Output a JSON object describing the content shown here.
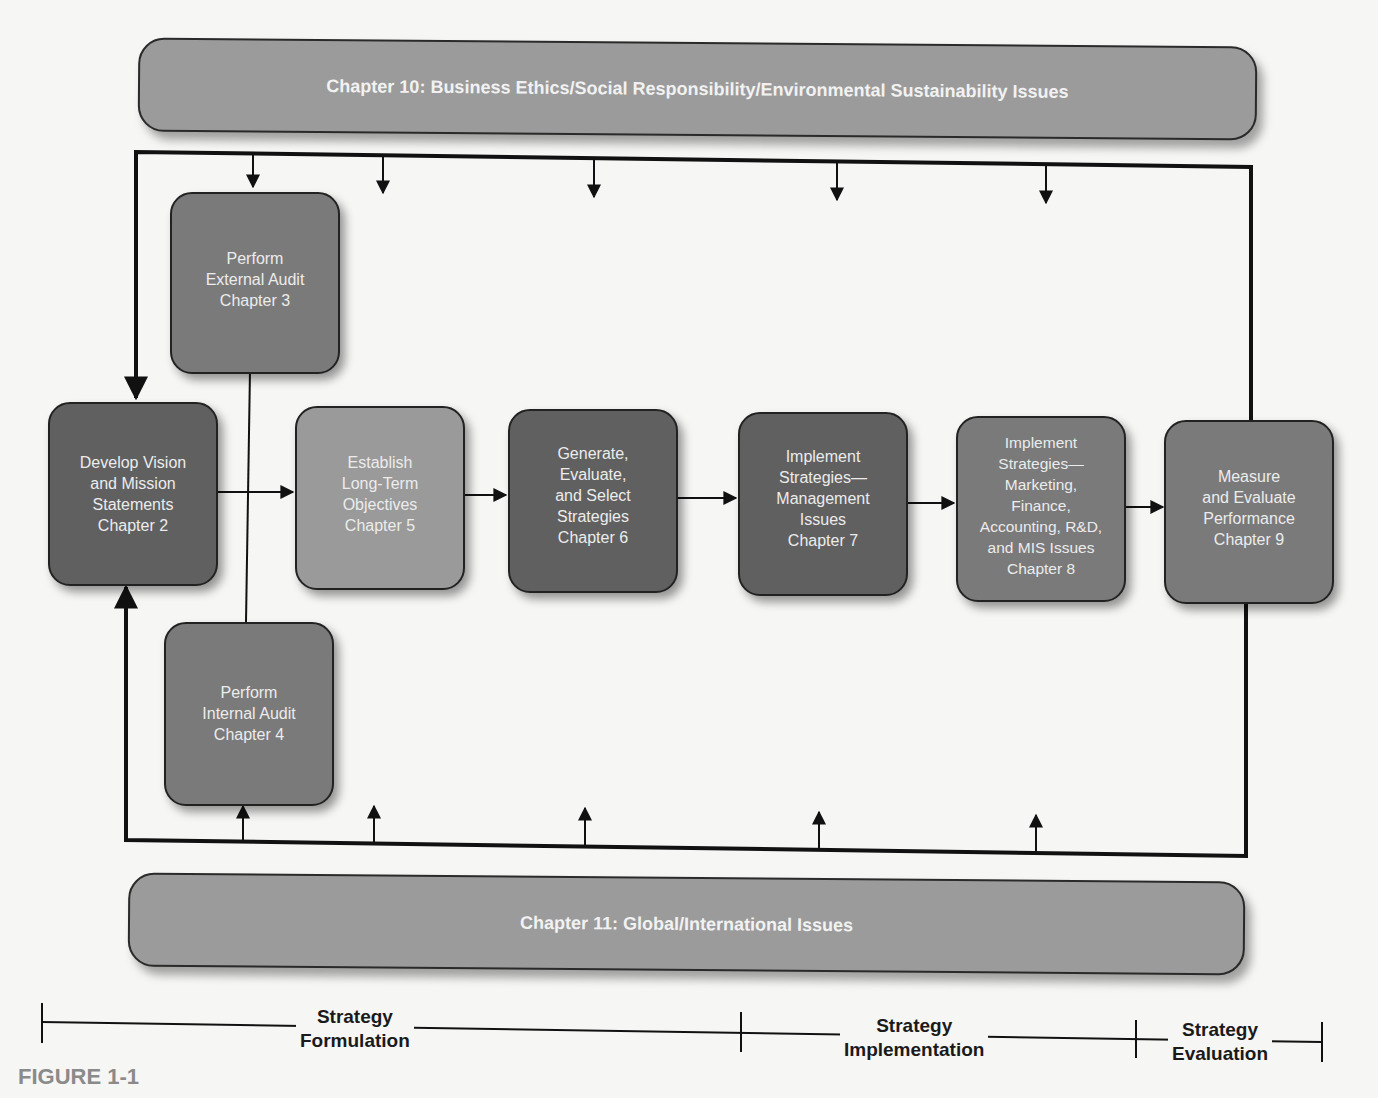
{
  "banners": {
    "top": "Chapter 10: Business Ethics/Social Responsibility/Environmental Sustainability Issues",
    "bottom": "Chapter 11:  Global/International Issues"
  },
  "boxes": {
    "external_audit": [
      "Perform",
      "External Audit",
      "Chapter 3"
    ],
    "vision_mission": [
      "Develop Vision",
      "and Mission",
      "Statements",
      "Chapter 2"
    ],
    "internal_audit": [
      "Perform",
      "Internal Audit",
      "Chapter 4"
    ],
    "objectives": [
      "Establish",
      "Long-Term",
      "Objectives",
      "Chapter 5"
    ],
    "strategies": [
      "Generate,",
      "Evaluate,",
      "and Select",
      "Strategies",
      "Chapter 6"
    ],
    "implement_mgmt": [
      "Implement",
      "Strategies—",
      "Management",
      "Issues",
      "Chapter 7"
    ],
    "implement_functional": [
      "Implement",
      "Strategies—",
      "Marketing,",
      "Finance,",
      "Accounting, R&D,",
      "and MIS Issues",
      "Chapter 8"
    ],
    "evaluate": [
      "Measure",
      "and Evaluate",
      "Performance",
      "Chapter 9"
    ]
  },
  "phases": {
    "formulation": [
      "Strategy",
      "Formulation"
    ],
    "implementation": [
      "Strategy",
      "Implementation"
    ],
    "evaluation": [
      "Strategy",
      "Evaluation"
    ]
  },
  "figure_label": "FIGURE 1-1",
  "colors": {
    "box_dark": "#606060",
    "box_mid": "#7a7a7a",
    "box_light": "#9a9a9a",
    "banner": "#9b9b9b",
    "line": "#111111"
  }
}
